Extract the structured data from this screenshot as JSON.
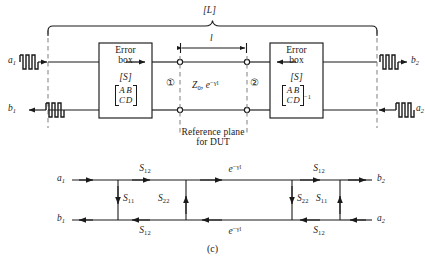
{
  "figure": {
    "caption": "(c)",
    "overall_label": "[L]",
    "reference_plane": {
      "line1": "Reference plane",
      "line2": "for DUT"
    },
    "length_label": "l",
    "line_label": {
      "z0": "Z",
      "z0_sub": "0",
      "sep": ", ",
      "prop": "e",
      "prop_sup": "−γl"
    },
    "ports": {
      "left": "①",
      "right": "②"
    }
  },
  "block_diagram": {
    "left_box": {
      "title_line1": "Error",
      "title_line2": "box",
      "s_label": "[S]",
      "matrix": {
        "r1c1": "A",
        "r1c2": "B",
        "r2c1": "C",
        "r2c2": "D",
        "exponent": ""
      },
      "arrow_direction": "right"
    },
    "right_box": {
      "title_line1": "Error",
      "title_line2": "box",
      "s_label": "[S]",
      "matrix": {
        "r1c1": "A",
        "r1c2": "B",
        "r2c1": "C",
        "r2c2": "D",
        "exponent": "−1"
      },
      "arrow_direction": "left"
    },
    "waves": {
      "a1": {
        "symbol": "a",
        "sub": "1",
        "direction": "right"
      },
      "b1": {
        "symbol": "b",
        "sub": "1",
        "direction": "left"
      },
      "b2": {
        "symbol": "b",
        "sub": "2",
        "direction": "right"
      },
      "a2": {
        "symbol": "a",
        "sub": "2",
        "direction": "left"
      }
    }
  },
  "flow_graph": {
    "nodes": {
      "a1": {
        "symbol": "a",
        "sub": "1"
      },
      "b1": {
        "symbol": "b",
        "sub": "1"
      },
      "b2": {
        "symbol": "b",
        "sub": "2"
      },
      "a2": {
        "symbol": "a",
        "sub": "2"
      }
    },
    "branches": {
      "top_left": {
        "label": "S",
        "sub": "12"
      },
      "top_center": {
        "label": "e",
        "sup": "−γl"
      },
      "top_right": {
        "label": "S",
        "sub": "12"
      },
      "bottom_left": {
        "label": "S",
        "sub": "12"
      },
      "bottom_center": {
        "label": "e",
        "sup": "−γl"
      },
      "bottom_right": {
        "label": "S",
        "sub": "12"
      },
      "vert_1": {
        "label": "S",
        "sub": "11",
        "direction": "down"
      },
      "vert_2": {
        "label": "S",
        "sub": "22",
        "direction": "up"
      },
      "vert_3": {
        "label": "S",
        "sub": "22",
        "direction": "down"
      },
      "vert_4": {
        "label": "S",
        "sub": "11",
        "direction": "up"
      }
    }
  },
  "colors": {
    "stroke": "#1a1a1a",
    "dashed": "#8a8a8a",
    "background": "#ffffff"
  }
}
